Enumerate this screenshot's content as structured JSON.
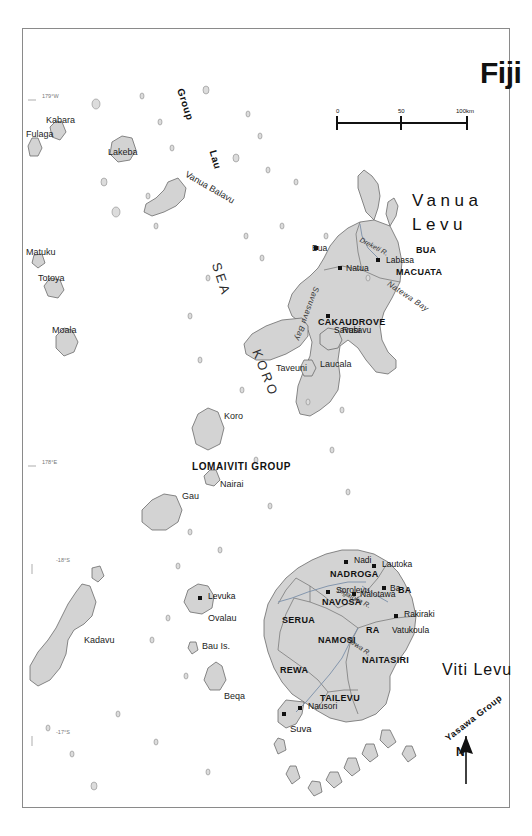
{
  "map": {
    "title": "Fiji",
    "north_label": "N",
    "scale_bar": {
      "ticks": [
        "0",
        "50",
        "100km"
      ],
      "unit": "km"
    },
    "graticule": {
      "lat_labels": [
        "-17°S",
        "-18°S"
      ],
      "lon_labels": [
        "178°E",
        "179°W"
      ]
    },
    "ocean_labels": [
      {
        "text": "KORO"
      },
      {
        "text": "SEA"
      }
    ],
    "main_islands": [
      {
        "name": "Vanua Levu",
        "line1": "Vanua",
        "line2": "Levu"
      },
      {
        "name": "Viti Levu",
        "line1": "Viti Levu",
        "line2": ""
      }
    ],
    "island_groups": [
      {
        "label": "Lau"
      },
      {
        "label": "Group"
      },
      {
        "label": "LOMAIVITI GROUP"
      },
      {
        "label": "Yasawa Group"
      }
    ],
    "provinces": [
      {
        "label": "MACUATA",
        "island": "Vanua Levu"
      },
      {
        "label": "CAKAUDROVE",
        "island": "Vanua Levu"
      },
      {
        "label": "BUA",
        "island": "Vanua Levu"
      },
      {
        "label": "RA",
        "island": "Viti Levu"
      },
      {
        "label": "BA",
        "island": "Viti Levu"
      },
      {
        "label": "NADROGA",
        "island": "Viti Levu"
      },
      {
        "label": "NAVOSA",
        "island": "Viti Levu"
      },
      {
        "label": "NAMOSI",
        "island": "Viti Levu"
      },
      {
        "label": "SERUA",
        "island": "Viti Levu"
      },
      {
        "label": "NAITASIRI",
        "island": "Viti Levu"
      },
      {
        "label": "REWA",
        "island": "Viti Levu"
      },
      {
        "label": "TAILEVU",
        "island": "Viti Levu"
      }
    ],
    "towns": [
      {
        "name": "Labasa"
      },
      {
        "name": "Savusavu"
      },
      {
        "name": "Natua"
      },
      {
        "name": "Bua"
      },
      {
        "name": "Rakiraki"
      },
      {
        "name": "Vatukoula"
      },
      {
        "name": "Ba"
      },
      {
        "name": "Nalotawa"
      },
      {
        "name": "Lautoka"
      },
      {
        "name": "Nadi"
      },
      {
        "name": "Sorolevu"
      },
      {
        "name": "Nausori"
      },
      {
        "name": "Suva"
      },
      {
        "name": "Levuka"
      }
    ],
    "small_islands": [
      {
        "name": "Vanua Balavu"
      },
      {
        "name": "Lakeba"
      },
      {
        "name": "Kabara"
      },
      {
        "name": "Fulaga"
      },
      {
        "name": "Moala"
      },
      {
        "name": "Totoya"
      },
      {
        "name": "Matuku"
      },
      {
        "name": "Koro"
      },
      {
        "name": "Nairai"
      },
      {
        "name": "Gau"
      },
      {
        "name": "Ovalau"
      },
      {
        "name": "Bau Is."
      },
      {
        "name": "Beqa"
      },
      {
        "name": "Kadavu"
      },
      {
        "name": "Rabi"
      },
      {
        "name": "Laucala"
      },
      {
        "name": "Taveuni"
      }
    ],
    "rivers": [
      {
        "name": "Dreketi R."
      },
      {
        "name": "Rewa R."
      },
      {
        "name": "Sigatoka R."
      }
    ],
    "bays": [
      {
        "name": "Natewa Bay"
      },
      {
        "name": "Savusavu Bay"
      }
    ],
    "colors": {
      "land": "#d3d3d3",
      "coastline": "#5a5a5a",
      "province_border": "#6e6e6e",
      "frame": "#8a8a8a",
      "text": "#1a1a1a",
      "background": "#ffffff"
    }
  }
}
